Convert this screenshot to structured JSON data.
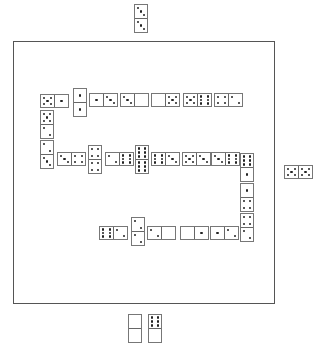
{
  "game": "Dominoes",
  "board": {
    "x": 13,
    "y": 41,
    "w": 260,
    "h": 261
  },
  "dominoes": [
    {
      "id": "top-player-tile",
      "orient": "v",
      "x": 134,
      "y": 4,
      "a": 3,
      "b": 3,
      "zone": "top-hand"
    },
    {
      "id": "right-player-tile",
      "orient": "h",
      "x": 284,
      "y": 165,
      "a": 5,
      "b": 5,
      "zone": "right-hand"
    },
    {
      "id": "bottom-hand-1",
      "orient": "v",
      "x": 128,
      "y": 314,
      "a": 0,
      "b": 0,
      "zone": "bottom-hand"
    },
    {
      "id": "bottom-hand-2",
      "orient": "v",
      "x": 148,
      "y": 314,
      "a": 6,
      "b": 0,
      "zone": "bottom-hand"
    },
    {
      "id": "chain-1",
      "orient": "h",
      "x": 40,
      "y": 94,
      "a": 5,
      "b": 1,
      "zone": "board"
    },
    {
      "id": "chain-2",
      "orient": "v",
      "x": 73,
      "y": 88,
      "a": 1,
      "b": 1,
      "zone": "board"
    },
    {
      "id": "chain-3",
      "orient": "h",
      "x": 89,
      "y": 93,
      "a": 1,
      "b": 3,
      "zone": "board"
    },
    {
      "id": "chain-4",
      "orient": "h",
      "x": 120,
      "y": 93,
      "a": 3,
      "b": 0,
      "zone": "board"
    },
    {
      "id": "chain-5",
      "orient": "h",
      "x": 151,
      "y": 93,
      "a": 0,
      "b": 5,
      "zone": "board"
    },
    {
      "id": "chain-6",
      "orient": "h",
      "x": 183,
      "y": 93,
      "a": 5,
      "b": 6,
      "zone": "board"
    },
    {
      "id": "chain-7",
      "orient": "h",
      "x": 214,
      "y": 93,
      "a": 4,
      "b": 2,
      "zone": "board"
    },
    {
      "id": "chain-8",
      "orient": "v",
      "x": 40,
      "y": 110,
      "a": 5,
      "b": 2,
      "zone": "board"
    },
    {
      "id": "chain-9",
      "orient": "v",
      "x": 40,
      "y": 140,
      "a": 2,
      "b": 3,
      "zone": "board"
    },
    {
      "id": "chain-10",
      "orient": "h",
      "x": 57,
      "y": 152,
      "a": 3,
      "b": 4,
      "zone": "board"
    },
    {
      "id": "chain-11",
      "orient": "v",
      "x": 88,
      "y": 145,
      "a": 4,
      "b": 4,
      "zone": "board"
    },
    {
      "id": "chain-12",
      "orient": "h",
      "x": 105,
      "y": 152,
      "a": 2,
      "b": 6,
      "zone": "board"
    },
    {
      "id": "chain-13",
      "orient": "v",
      "x": 135,
      "y": 145,
      "a": 6,
      "b": 6,
      "zone": "board"
    },
    {
      "id": "chain-14",
      "orient": "h",
      "x": 151,
      "y": 152,
      "a": 6,
      "b": 3,
      "zone": "board"
    },
    {
      "id": "chain-15",
      "orient": "h",
      "x": 182,
      "y": 152,
      "a": 5,
      "b": 3,
      "zone": "board"
    },
    {
      "id": "chain-16",
      "orient": "h",
      "x": 211,
      "y": 152,
      "a": 3,
      "b": 6,
      "zone": "board"
    },
    {
      "id": "chain-17",
      "orient": "v",
      "x": 240,
      "y": 153,
      "a": 6,
      "b": 1,
      "zone": "board"
    },
    {
      "id": "chain-18",
      "orient": "v",
      "x": 240,
      "y": 183,
      "a": 1,
      "b": 4,
      "zone": "board"
    },
    {
      "id": "chain-19",
      "orient": "v",
      "x": 240,
      "y": 213,
      "a": 4,
      "b": 2,
      "zone": "board"
    },
    {
      "id": "chain-20",
      "orient": "h",
      "x": 99,
      "y": 226,
      "a": 6,
      "b": 2,
      "zone": "board"
    },
    {
      "id": "chain-21",
      "orient": "v",
      "x": 131,
      "y": 217,
      "a": 2,
      "b": 2,
      "zone": "board"
    },
    {
      "id": "chain-22",
      "orient": "h",
      "x": 147,
      "y": 226,
      "a": 2,
      "b": 0,
      "zone": "board"
    },
    {
      "id": "chain-23",
      "orient": "h",
      "x": 180,
      "y": 226,
      "a": 0,
      "b": 1,
      "zone": "board"
    },
    {
      "id": "chain-24",
      "orient": "h",
      "x": 210,
      "y": 226,
      "a": 1,
      "b": 2,
      "zone": "board"
    }
  ]
}
